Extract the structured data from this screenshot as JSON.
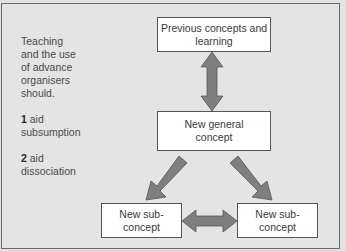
{
  "diagram": {
    "side_note": {
      "intro": "Teaching and the use of advance organisers should.",
      "items": [
        {
          "number": "1",
          "text": "aid subsumption"
        },
        {
          "number": "2",
          "text": "aid dissociation"
        }
      ]
    },
    "nodes": {
      "previous": "Previous concepts and learning",
      "general": "New general concept",
      "sub_left": "New sub-concept",
      "sub_right": "New sub-concept"
    },
    "edges": [
      {
        "from": "previous",
        "to": "general",
        "type": "bidirectional"
      },
      {
        "from": "general",
        "to": "sub_left",
        "type": "directed"
      },
      {
        "from": "general",
        "to": "sub_right",
        "type": "directed"
      },
      {
        "from": "sub_left",
        "to": "sub_right",
        "type": "bidirectional"
      }
    ],
    "colors": {
      "background": "#e4e4e4",
      "arrow_fill": "#7f7f7f",
      "box_fill": "#ffffff"
    }
  }
}
